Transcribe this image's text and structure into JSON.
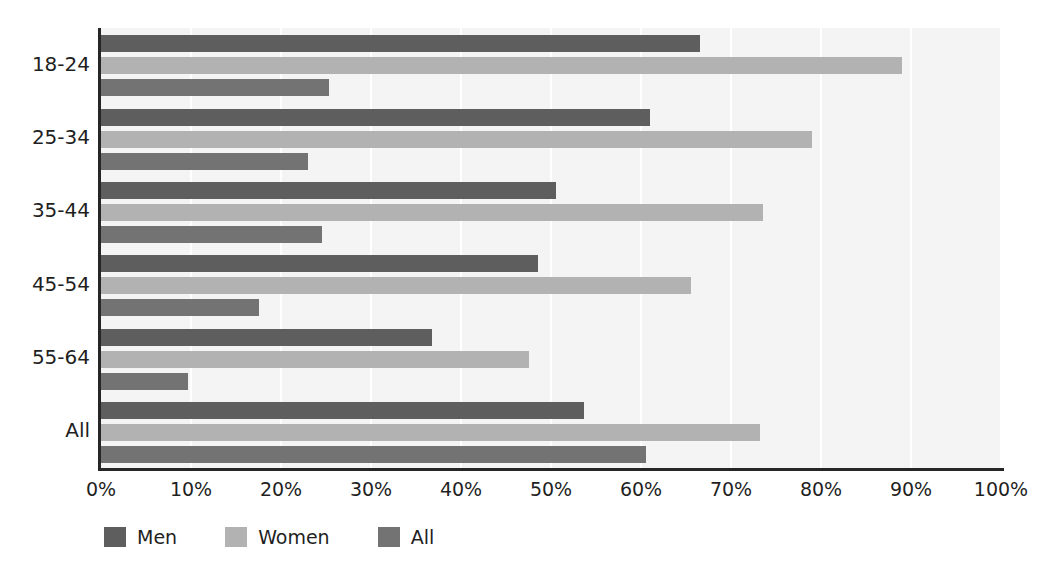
{
  "chart_data": {
    "type": "bar",
    "orientation": "horizontal",
    "title": "",
    "subtitle": "",
    "xlabel": "",
    "ylabel": "",
    "xlim": [
      0,
      100
    ],
    "xtick_labels": [
      "0%",
      "10%",
      "20%",
      "30%",
      "40%",
      "50%",
      "60%",
      "70%",
      "80%",
      "90%",
      "100%"
    ],
    "xticks": [
      0,
      10,
      20,
      30,
      40,
      50,
      60,
      70,
      80,
      90,
      100
    ],
    "grid": true,
    "grid_axis": "x",
    "legend_position": "bottom-left",
    "categories": [
      "18-24",
      "25-34",
      "35-44",
      "45-54",
      "55-64",
      "All"
    ],
    "series": [
      {
        "name": "Men",
        "color": "#5e5e5e",
        "values": [
          66.5,
          61.0,
          50.5,
          48.5,
          36.8,
          53.7
        ]
      },
      {
        "name": "Women",
        "color": "#b2b2b2",
        "values": [
          89.0,
          79.0,
          73.5,
          65.5,
          47.5,
          73.2
        ]
      },
      {
        "name": "All",
        "color": "#737373",
        "values": [
          25.3,
          23.0,
          24.5,
          17.5,
          9.7,
          60.5
        ]
      }
    ]
  },
  "legend": {
    "items": [
      {
        "label": "Men",
        "color": "#5e5e5e"
      },
      {
        "label": "Women",
        "color": "#b2b2b2"
      },
      {
        "label": "All",
        "color": "#737373"
      }
    ]
  },
  "colors": {
    "plot_background": "#f4f4f4",
    "page_background": "#ffffff",
    "axis": "#262626",
    "gridline": "#ffffff",
    "text": "#1f1f1f"
  }
}
